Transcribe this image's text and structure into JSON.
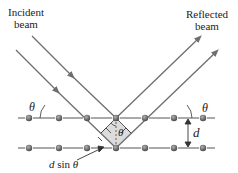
{
  "diagram": {
    "labels": {
      "incident": [
        "Incident",
        "beam"
      ],
      "reflected": [
        "Reflected",
        "beam"
      ],
      "theta_left": "θ",
      "theta_right": "θ",
      "theta_center": "θ",
      "spacing": "d",
      "path_diff_d": "d",
      "path_diff_sin": "sin",
      "path_diff_theta": "θ"
    },
    "colors": {
      "beam": "#6e6e6e",
      "plane": "#555555",
      "atom": "#6a6a6a",
      "shade": "#d9d9d9",
      "text": "#222222"
    },
    "planes": [
      {
        "y": 118,
        "atoms_x": [
          29,
          59,
          87,
          116,
          145,
          174,
          203
        ]
      },
      {
        "y": 148,
        "atoms_x": [
          29,
          59,
          87,
          116,
          145,
          174,
          203
        ]
      }
    ]
  }
}
